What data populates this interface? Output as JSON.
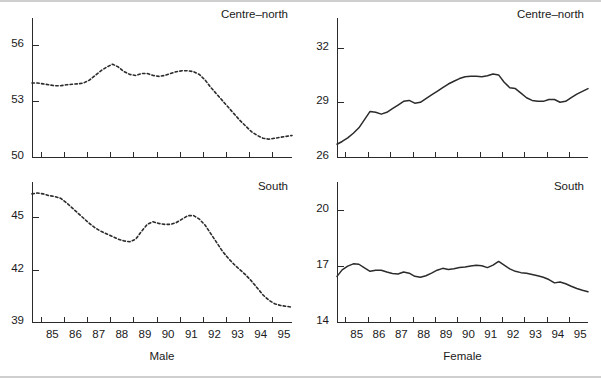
{
  "figure": {
    "width": 601,
    "height": 378,
    "background": "#ffffff",
    "line_color": "#2b2b2b"
  },
  "panels": [
    {
      "id": "top-left",
      "title": "Centre–north",
      "xlabel": "",
      "ylabel": "",
      "style": "dashed",
      "ylim": [
        50,
        57.2
      ],
      "yticks": [
        50,
        53,
        56
      ],
      "ytick_labels": [
        "50",
        "53",
        "56"
      ],
      "show_xticklabels": false
    },
    {
      "id": "top-right",
      "title": "Centre–north",
      "xlabel": "",
      "ylabel": "",
      "style": "solid",
      "ylim": [
        26,
        33.4
      ],
      "yticks": [
        26,
        29,
        32
      ],
      "ytick_labels": [
        "26",
        "29",
        "32"
      ],
      "show_xticklabels": false
    },
    {
      "id": "bottom-left",
      "title": "South",
      "xlabel": "Male",
      "ylabel": "",
      "style": "dashed",
      "ylim": [
        39,
        46.8
      ],
      "yticks": [
        39,
        42,
        45
      ],
      "ytick_labels": [
        "39",
        "42",
        "45"
      ],
      "show_xticklabels": true
    },
    {
      "id": "bottom-right",
      "title": "South",
      "xlabel": "Female",
      "ylabel": "",
      "style": "solid",
      "ylim": [
        14,
        21.3
      ],
      "yticks": [
        14,
        17,
        20
      ],
      "ytick_labels": [
        "14",
        "17",
        "20"
      ],
      "show_xticklabels": true
    }
  ],
  "xaxis": {
    "tick_values": [
      85,
      86,
      87,
      88,
      89,
      90,
      91,
      92,
      93,
      94,
      95,
      96
    ],
    "tick_labels": [
      "85",
      "86",
      "87",
      "88",
      "89",
      "90",
      "91",
      "92",
      "93",
      "94",
      "95"
    ],
    "xlim": [
      84.62,
      95.85
    ]
  },
  "chart_data": {
    "type": "line",
    "title": "",
    "subtitle": "",
    "xlabel": "Year",
    "ylabel": "Rate (%)",
    "layout": "2x2 panel grid",
    "grid": false,
    "legend": "none",
    "xlim": [
      84.62,
      95.85
    ],
    "x_tick_labels": [
      "85",
      "86",
      "87",
      "88",
      "89",
      "90",
      "91",
      "92",
      "93",
      "94",
      "95"
    ],
    "panels": [
      {
        "name": "Centre–north Male",
        "row": 0,
        "col": 0,
        "title": "Centre–north",
        "xlabel": "Male",
        "ylabel": "",
        "linestyle": "dashed",
        "ylim": [
          50,
          57.2
        ],
        "yticks": [
          50,
          53,
          56
        ],
        "x": [
          84.62,
          84.85,
          85.1,
          85.35,
          85.6,
          85.85,
          86.1,
          86.35,
          86.6,
          86.85,
          87.1,
          87.35,
          87.6,
          87.85,
          88.1,
          88.35,
          88.6,
          88.85,
          89.1,
          89.35,
          89.6,
          89.85,
          90.1,
          90.35,
          90.6,
          90.85,
          91.1,
          91.35,
          91.6,
          91.85,
          92.1,
          92.35,
          92.6,
          92.85,
          93.1,
          93.35,
          93.6,
          93.85,
          94.1,
          94.35,
          94.6,
          94.85,
          95.1,
          95.35,
          95.6,
          95.85
        ],
        "y": [
          53.95,
          53.95,
          53.9,
          53.85,
          53.8,
          53.8,
          53.85,
          53.88,
          53.9,
          53.95,
          54.1,
          54.35,
          54.6,
          54.8,
          54.95,
          54.8,
          54.55,
          54.4,
          54.35,
          54.45,
          54.45,
          54.35,
          54.3,
          54.35,
          54.45,
          54.55,
          54.6,
          54.6,
          54.55,
          54.4,
          54.1,
          53.7,
          53.35,
          53.0,
          52.65,
          52.3,
          51.95,
          51.65,
          51.35,
          51.15,
          51.0,
          50.95,
          51.0,
          51.05,
          51.1,
          51.15
        ]
      },
      {
        "name": "Centre–north Female",
        "row": 0,
        "col": 1,
        "title": "Centre–north",
        "xlabel": "Female",
        "ylabel": "",
        "linestyle": "solid",
        "ylim": [
          26,
          33.4
        ],
        "yticks": [
          26,
          29,
          32
        ],
        "x": [
          84.62,
          84.85,
          85.1,
          85.35,
          85.6,
          85.85,
          86.1,
          86.35,
          86.6,
          86.85,
          87.1,
          87.35,
          87.6,
          87.85,
          88.1,
          88.35,
          88.6,
          88.85,
          89.1,
          89.35,
          89.6,
          89.85,
          90.1,
          90.35,
          90.6,
          90.85,
          91.1,
          91.35,
          91.6,
          91.85,
          92.1,
          92.35,
          92.6,
          92.85,
          93.1,
          93.35,
          93.6,
          93.85,
          94.1,
          94.35,
          94.6,
          94.85,
          95.1,
          95.35,
          95.6,
          95.85
        ],
        "y": [
          26.7,
          26.85,
          27.05,
          27.3,
          27.6,
          28.05,
          28.5,
          28.45,
          28.35,
          28.45,
          28.65,
          28.85,
          29.05,
          29.1,
          28.95,
          29.0,
          29.2,
          29.4,
          29.6,
          29.8,
          30.0,
          30.15,
          30.3,
          30.4,
          30.42,
          30.42,
          30.4,
          30.45,
          30.55,
          30.5,
          30.1,
          29.8,
          29.75,
          29.5,
          29.25,
          29.1,
          29.05,
          29.05,
          29.15,
          29.15,
          29.0,
          29.05,
          29.25,
          29.45,
          29.6,
          29.75
        ]
      },
      {
        "name": "South Male",
        "row": 1,
        "col": 0,
        "title": "South",
        "xlabel": "Male",
        "ylabel": "",
        "linestyle": "dashed",
        "ylim": [
          39,
          46.8
        ],
        "yticks": [
          39,
          42,
          45
        ],
        "x": [
          84.62,
          84.85,
          85.1,
          85.35,
          85.6,
          85.85,
          86.1,
          86.35,
          86.6,
          86.85,
          87.1,
          87.35,
          87.6,
          87.85,
          88.1,
          88.35,
          88.6,
          88.85,
          89.1,
          89.35,
          89.6,
          89.85,
          90.1,
          90.35,
          90.6,
          90.85,
          91.1,
          91.35,
          91.6,
          91.85,
          92.1,
          92.35,
          92.6,
          92.85,
          93.1,
          93.35,
          93.6,
          93.85,
          94.1,
          94.35,
          94.6,
          94.85,
          95.1,
          95.35,
          95.6,
          95.85
        ],
        "y": [
          46.35,
          46.4,
          46.35,
          46.25,
          46.2,
          46.1,
          45.85,
          45.55,
          45.25,
          44.95,
          44.65,
          44.4,
          44.2,
          44.05,
          43.9,
          43.75,
          43.65,
          43.6,
          43.75,
          44.2,
          44.6,
          44.75,
          44.65,
          44.6,
          44.6,
          44.7,
          44.9,
          45.1,
          45.1,
          44.9,
          44.55,
          44.05,
          43.55,
          43.05,
          42.65,
          42.3,
          42.0,
          41.7,
          41.35,
          40.95,
          40.55,
          40.25,
          40.05,
          39.95,
          39.9,
          39.85
        ]
      },
      {
        "name": "South Female",
        "row": 1,
        "col": 1,
        "title": "South",
        "xlabel": "Female",
        "ylabel": "",
        "linestyle": "solid",
        "ylim": [
          14,
          21.3
        ],
        "yticks": [
          14,
          17,
          20
        ],
        "x": [
          84.62,
          84.85,
          85.1,
          85.35,
          85.6,
          85.85,
          86.1,
          86.35,
          86.6,
          86.85,
          87.1,
          87.35,
          87.6,
          87.85,
          88.1,
          88.35,
          88.6,
          88.85,
          89.1,
          89.35,
          89.6,
          89.85,
          90.1,
          90.35,
          90.6,
          90.85,
          91.1,
          91.35,
          91.6,
          91.85,
          92.1,
          92.35,
          92.6,
          92.85,
          93.1,
          93.35,
          93.6,
          93.85,
          94.1,
          94.35,
          94.6,
          94.85,
          95.1,
          95.35,
          95.6,
          95.85
        ],
        "y": [
          16.45,
          16.8,
          17.0,
          17.12,
          17.1,
          16.9,
          16.72,
          16.78,
          16.78,
          16.68,
          16.6,
          16.58,
          16.68,
          16.62,
          16.45,
          16.4,
          16.48,
          16.62,
          16.78,
          16.88,
          16.82,
          16.86,
          16.92,
          16.95,
          17.0,
          17.05,
          17.02,
          16.92,
          17.05,
          17.25,
          17.05,
          16.85,
          16.72,
          16.65,
          16.62,
          16.55,
          16.48,
          16.4,
          16.28,
          16.1,
          16.15,
          16.05,
          15.92,
          15.8,
          15.7,
          15.62
        ]
      }
    ]
  }
}
